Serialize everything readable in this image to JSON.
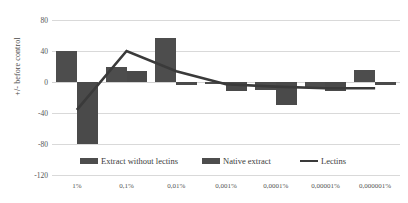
{
  "chart_data": {
    "type": "bar",
    "title": "",
    "xlabel": "",
    "ylabel": "+/- before control",
    "ylim": [
      -120,
      80
    ],
    "yticks": [
      80,
      40,
      0,
      -40,
      -80,
      -120
    ],
    "ytick_labels": [
      "80",
      "40",
      "0",
      "-40",
      "-80",
      "-120"
    ],
    "grid": true,
    "legend_position": "bottom",
    "categories": [
      "1%",
      "0,1%",
      "0,01%",
      "0,001%",
      "0,0001%",
      "0,00001%",
      "0,000001%"
    ],
    "series": [
      {
        "name": "Extract without lectins",
        "type": "bar",
        "color": "#4d4d4d",
        "values": [
          40,
          20,
          57,
          -2,
          -10,
          -8,
          16
        ]
      },
      {
        "name": "Native extract",
        "type": "bar",
        "color": "#4a4a4a",
        "values": [
          -80,
          14,
          -4,
          -12,
          -30,
          -12,
          -4
        ]
      },
      {
        "name": "Lectins",
        "type": "line",
        "color": "#3a3a3a",
        "values": [
          -36,
          40,
          14,
          -3,
          -6,
          -8,
          -8
        ]
      }
    ]
  },
  "legend": {
    "items": [
      {
        "label": "Extract without lectins",
        "marker": "bar-swatch"
      },
      {
        "label": "Native extract",
        "marker": "bar-swatch"
      },
      {
        "label": "Lectins",
        "marker": "line-swatch"
      }
    ]
  }
}
